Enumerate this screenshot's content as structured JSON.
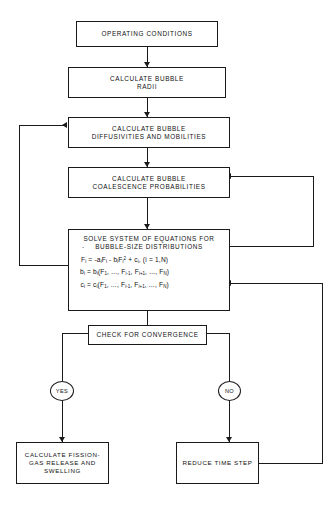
{
  "diagram": {
    "colors": {
      "line": "#1a1a1a",
      "text": "#111111",
      "background": "#ffffff"
    },
    "nodes": {
      "operating_conditions": {
        "label": "OPERATING CONDITIONS"
      },
      "calc_radii": {
        "line1": "CALCULATE BUBBLE",
        "line2": "RADII"
      },
      "calc_diffusivities": {
        "line1": "CALCULATE BUBBLE",
        "line2": "DIFFUSIVITIES AND MOBILITIES"
      },
      "calc_coalescence": {
        "line1": "CALCULATE BUBBLE",
        "line2": "COALESCENCE PROBABILITIES"
      },
      "solve_system": {
        "line1": "SOLVE SYSTEM OF EQUATIONS FOR",
        "line2": "BUBBLE-SIZE DISTRIBUTIONS",
        "equations": [
          "Ḟi = -aiFi - biFi2 + ci, (i = 1,N)",
          "bi = bi(F1, ..., Fi-1, Fi+1, ..., FN)",
          "ci = ci(F1, ..., Fi-1, Fi+1, ..., FN)"
        ]
      },
      "check_convergence": {
        "label": "CHECK FOR CONVERGENCE"
      },
      "yes_branch": {
        "label": "YES"
      },
      "no_branch": {
        "label": "NO"
      },
      "calc_release": {
        "line1": "CALCULATE FISSION-",
        "line2": "GAS RELEASE AND",
        "line3": "SWELLING"
      },
      "reduce_time_step": {
        "label": "REDUCE TIME STEP"
      }
    },
    "equation_parts": {
      "eq1": {
        "lhs_var": "F",
        "lhs_sub": "i",
        "eq": "=",
        "t1": "-a",
        "t1sub": "i",
        "t1v": "F",
        "t1vsub": "i",
        "minus": "-",
        "t2": "b",
        "t2sub": "i",
        "t2v": "F",
        "t2vsub": "i",
        "t2sup": "2",
        "plus": "+",
        "t3": "c",
        "t3sub": "i",
        "tail": ", (i = 1,N)"
      },
      "eq2": {
        "lhs": "b",
        "lhs_sub": "i",
        "eq": "=",
        "rhs": "b",
        "rhs_sub": "i",
        "open": "(F",
        "s1": "1",
        "mid1": ", ..., F",
        "s2": "i-1",
        "mid2": ", F",
        "s3": "i+1",
        "mid3": ", ..., F",
        "s4": "N",
        "close": ")"
      },
      "eq3": {
        "lhs": "c",
        "lhs_sub": "i",
        "eq": "=",
        "rhs": "c",
        "rhs_sub": "i",
        "open": "(F",
        "s1": "1",
        "mid1": ", ..., F",
        "s2": "i-1",
        "mid2": ", F",
        "s3": "i+1",
        "mid3": ", ..., F",
        "s4": "N",
        "close": ")"
      }
    },
    "edges": [
      {
        "from": "operating_conditions",
        "to": "calc_radii",
        "kind": "down-arrow"
      },
      {
        "from": "calc_radii",
        "to": "calc_diffusivities",
        "kind": "down-arrow"
      },
      {
        "from": "calc_diffusivities",
        "to": "calc_coalescence",
        "kind": "down-arrow"
      },
      {
        "from": "calc_coalescence",
        "to": "solve_system",
        "kind": "down-arrow"
      },
      {
        "from": "solve_system",
        "to": "check_convergence",
        "kind": "down-arrow"
      },
      {
        "from": "solve_system",
        "to": "calc_diffusivities",
        "kind": "feedback-left"
      },
      {
        "from": "solve_system",
        "to": "calc_coalescence",
        "kind": "feedback-right-inner"
      },
      {
        "from": "check_convergence",
        "to": "yes_branch",
        "kind": "left-down"
      },
      {
        "from": "check_convergence",
        "to": "no_branch",
        "kind": "right-down"
      },
      {
        "from": "yes_branch",
        "to": "calc_release",
        "kind": "down-arrow"
      },
      {
        "from": "no_branch",
        "to": "reduce_time_step",
        "kind": "down-arrow"
      },
      {
        "from": "reduce_time_step",
        "to": "solve_system",
        "kind": "feedback-right-outer"
      }
    ]
  }
}
